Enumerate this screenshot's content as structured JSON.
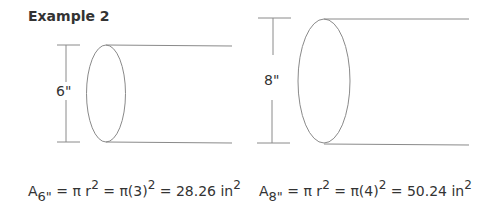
{
  "title": "Example 2",
  "figures": [
    {
      "dimension_label": "6\"",
      "formula": {
        "subscript": "6\"",
        "parts": [
          "A",
          "= π r",
          "2",
          "= π(3)",
          "2",
          "= 28.26 in",
          "2"
        ]
      }
    },
    {
      "dimension_label": "8\"",
      "formula": {
        "subscript": "8\"",
        "parts": [
          "A",
          "= π r",
          "2",
          "= π(4)",
          "2",
          "= 50.24 in",
          "2"
        ]
      }
    }
  ],
  "colors": {
    "line": "#888888",
    "text": "#333333"
  }
}
